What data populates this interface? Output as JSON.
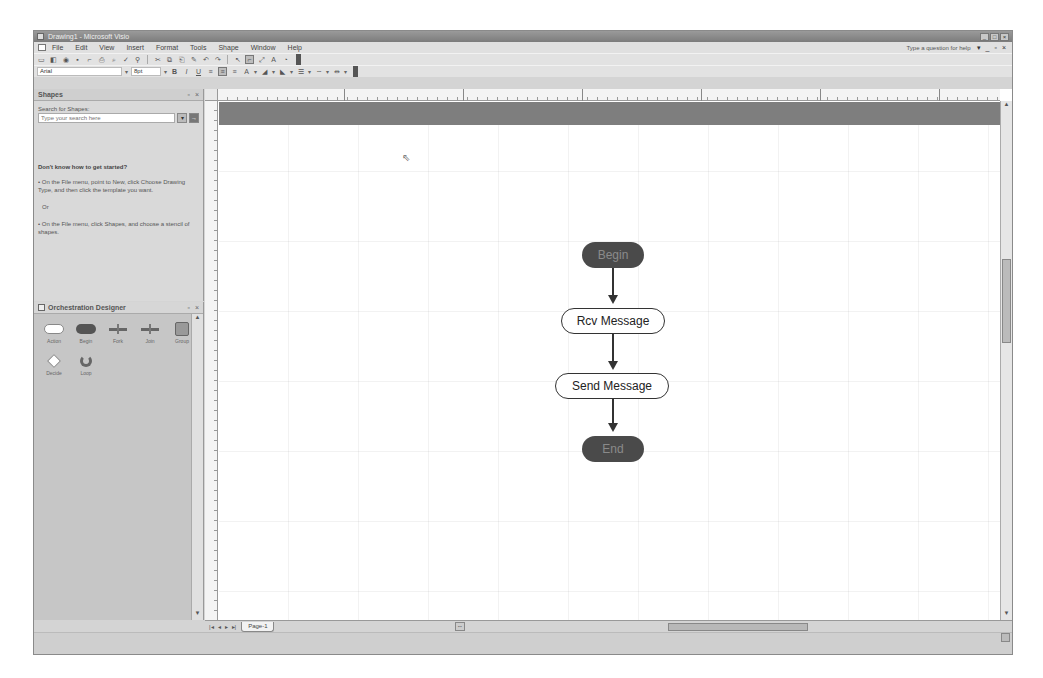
{
  "window": {
    "title": "Drawing1 - Microsoft Visio",
    "controls": [
      "_",
      "□",
      "×"
    ]
  },
  "menubar": {
    "items": [
      "File",
      "Edit",
      "View",
      "Insert",
      "Format",
      "Tools",
      "Shape",
      "Window",
      "Help"
    ],
    "help_box": "Type a question for help",
    "doc_controls": [
      "▾",
      "_",
      "▫",
      "×"
    ]
  },
  "toolbar": {
    "font": "Arial",
    "font_size": "8pt"
  },
  "shapes_pane": {
    "title": "Shapes",
    "search_label": "Search for Shapes:",
    "search_placeholder": "Type your search here",
    "help_heading": "Don't know how to get started?",
    "help_items": [
      "• On the File menu, point to New, click Choose Drawing Type, and then click the template you want.",
      "Or",
      "• On the File menu, click Shapes, and choose a stencil of shapes."
    ]
  },
  "stencil": {
    "title": "Orchestration Designer",
    "masters": [
      {
        "label": "Action",
        "icon": "action-shape-icon"
      },
      {
        "label": "Begin",
        "icon": "terminal-shape-icon"
      },
      {
        "label": "Fork",
        "icon": "fork-shape-icon"
      },
      {
        "label": "Join",
        "icon": "join-shape-icon"
      },
      {
        "label": "Group",
        "icon": "group-shape-icon"
      },
      {
        "label": "Decide",
        "icon": "decide-shape-icon"
      },
      {
        "label": "Loop",
        "icon": "loop-shape-icon"
      }
    ]
  },
  "diagram": {
    "nodes": [
      {
        "id": "begin",
        "label": "Begin",
        "type": "terminal"
      },
      {
        "id": "rcv",
        "label": "Rcv Message",
        "type": "action"
      },
      {
        "id": "send",
        "label": "Send Message",
        "type": "action"
      },
      {
        "id": "end",
        "label": "End",
        "type": "terminal"
      }
    ]
  },
  "pages": {
    "nav": [
      "|◂",
      "◂",
      "▸",
      "▸|"
    ],
    "tabs": [
      "Page-1"
    ]
  },
  "colors": {
    "header_band": "#7e7e7e",
    "terminal_fill": "#4a4a4a",
    "action_fill": "#ffffff",
    "connector": "#333333"
  }
}
